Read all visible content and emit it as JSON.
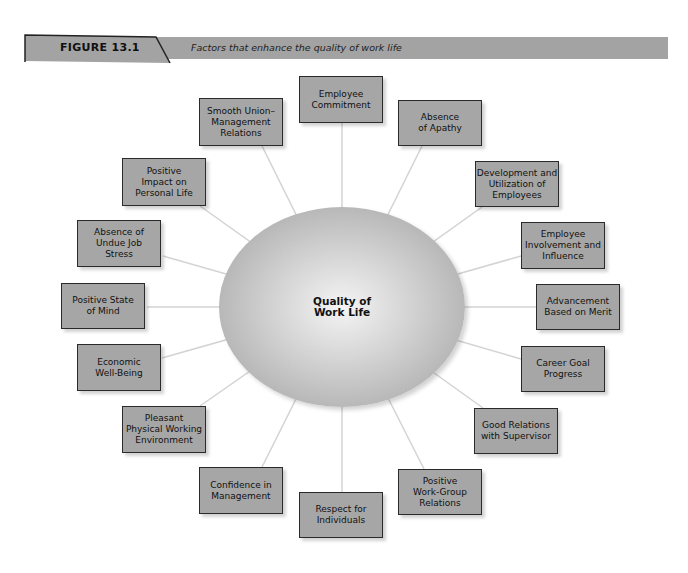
{
  "header": {
    "figure_label": "FIGURE 13.1",
    "caption": "Factors that enhance the quality of work life"
  },
  "colors": {
    "box_fill": "#a6a6a6",
    "header_bar": "#a3a3a3",
    "connector": "#d0d0d0",
    "border": "#2a2a2a"
  },
  "hub": {
    "label": "Quality of\nWork Life"
  },
  "factors": [
    {
      "label": "Employee\nCommitment"
    },
    {
      "label": "Absence\nof Apathy"
    },
    {
      "label": "Development and\nUtilization of\nEmployees"
    },
    {
      "label": "Employee\nInvolvement and\nInfluence"
    },
    {
      "label": "Advancement\nBased on Merit"
    },
    {
      "label": "Career Goal\nProgress"
    },
    {
      "label": "Good Relations\nwith Supervisor"
    },
    {
      "label": "Positive\nWork-Group\nRelations"
    },
    {
      "label": "Respect for\nIndividuals"
    },
    {
      "label": "Confidence in\nManagement"
    },
    {
      "label": "Pleasant\nPhysical Working\nEnvironment"
    },
    {
      "label": "Economic\nWell-Being"
    },
    {
      "label": "Positive State\nof Mind"
    },
    {
      "label": "Absence of\nUndue Job\nStress"
    },
    {
      "label": "Positive\nImpact on\nPersonal Life"
    },
    {
      "label": "Smooth Union–\nManagement\nRelations"
    }
  ]
}
